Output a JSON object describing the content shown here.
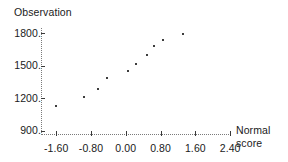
{
  "chart_data": {
    "type": "scatter",
    "title": "",
    "ylabel": "Observation",
    "xlabel": "Normal score",
    "xlabel_lines": [
      "Normal",
      "score"
    ],
    "grid": false,
    "legend": "none",
    "xlim": [
      -1.95,
      2.65
    ],
    "ylim": [
      860,
      1850
    ],
    "xticks": [
      -1.6,
      -0.8,
      0.0,
      0.8,
      1.6,
      2.4
    ],
    "xtick_labels": [
      "-1.60",
      "-0.80",
      "0.00",
      "0.80",
      "1.60",
      "2.40"
    ],
    "yticks": [
      900,
      1200,
      1500,
      1800
    ],
    "ytick_labels": [
      "900.",
      "1200.",
      "1500.",
      "1800."
    ],
    "x": [
      -1.6,
      -0.97,
      -0.65,
      -0.43,
      0.05,
      0.23,
      0.48,
      0.64,
      0.86,
      1.32
    ],
    "y": [
      1130,
      1215,
      1290,
      1390,
      1450,
      1515,
      1600,
      1680,
      1735,
      1795
    ],
    "points": [
      {
        "x": -1.6,
        "y": 1130
      },
      {
        "x": -0.97,
        "y": 1215
      },
      {
        "x": -0.65,
        "y": 1290
      },
      {
        "x": -0.43,
        "y": 1390
      },
      {
        "x": 0.05,
        "y": 1450
      },
      {
        "x": 0.23,
        "y": 1515
      },
      {
        "x": 0.48,
        "y": 1600
      },
      {
        "x": 0.64,
        "y": 1680
      },
      {
        "x": 0.86,
        "y": 1735
      },
      {
        "x": 1.32,
        "y": 1795
      }
    ],
    "marker": "dot",
    "marker_color": "#3c3c3c",
    "axis_color": "#7a7a7a",
    "tick_color": "#3a3a3a",
    "background": "#ffffff"
  }
}
